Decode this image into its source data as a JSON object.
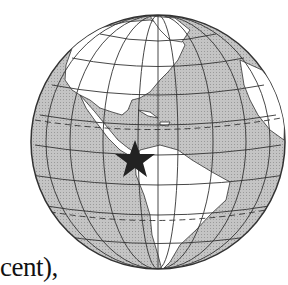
{
  "map": {
    "projection": "orthographic",
    "center_region": "Americas",
    "ocean_color": "#bdbdbd",
    "land_color": "#ffffff",
    "grid_color": "#333333",
    "marker": {
      "type": "star",
      "label": "Panama / Central America",
      "color": "#222222"
    }
  },
  "caption": {
    "text": "cent),"
  }
}
